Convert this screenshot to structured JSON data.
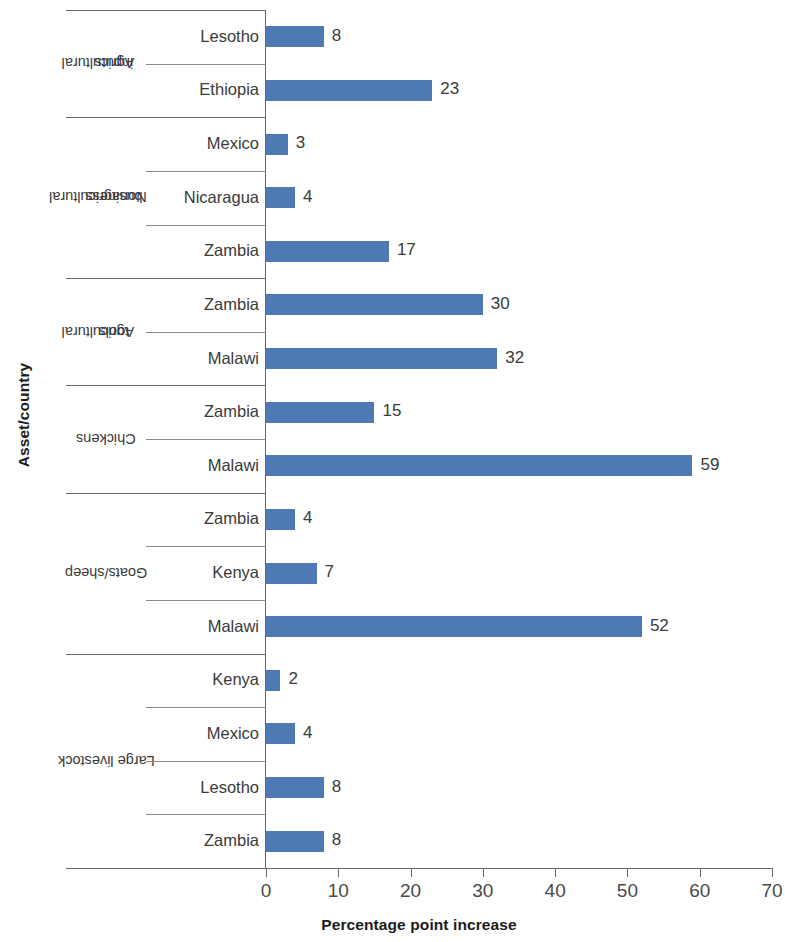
{
  "chart_data": {
    "type": "bar",
    "orientation": "horizontal",
    "title": "",
    "xlabel": "Percentage point increase",
    "ylabel": "Asset/country",
    "xlim": [
      0,
      70
    ],
    "xticks": [
      0,
      10,
      20,
      30,
      40,
      50,
      60,
      70
    ],
    "grid": false,
    "legend": null,
    "bar_color": "#4e79b2",
    "groups": [
      {
        "label": "Agricultural inputs",
        "label_lines": [
          "Agricultural",
          "inputs"
        ],
        "rows": [
          {
            "category": "Lesotho",
            "value": 8
          },
          {
            "category": "Ethiopia",
            "value": 23
          }
        ]
      },
      {
        "label": "Nonagricultural business",
        "label_lines": [
          "Nonagricultural",
          "business"
        ],
        "rows": [
          {
            "category": "Mexico",
            "value": 3
          },
          {
            "category": "Nicaragua",
            "value": 4
          },
          {
            "category": "Zambia",
            "value": 17
          }
        ]
      },
      {
        "label": "Agricultural tools",
        "label_lines": [
          "Agricultural",
          "tools"
        ],
        "rows": [
          {
            "category": "Zambia",
            "value": 30
          },
          {
            "category": "Malawi",
            "value": 32
          }
        ]
      },
      {
        "label": "Chickens",
        "label_lines": [
          "Chickens"
        ],
        "rows": [
          {
            "category": "Zambia",
            "value": 15
          },
          {
            "category": "Malawi",
            "value": 59
          }
        ]
      },
      {
        "label": "Goats/sheep",
        "label_lines": [
          "Goats/sheep"
        ],
        "rows": [
          {
            "category": "Zambia",
            "value": 4
          },
          {
            "category": "Kenya",
            "value": 7
          },
          {
            "category": "Malawi",
            "value": 52
          }
        ]
      },
      {
        "label": "Large livestock",
        "label_lines": [
          "Large livestock"
        ],
        "rows": [
          {
            "category": "Kenya",
            "value": 2
          },
          {
            "category": "Mexico",
            "value": 4
          },
          {
            "category": "Lesotho",
            "value": 8
          },
          {
            "category": "Zambia",
            "value": 8
          }
        ]
      }
    ],
    "categories": [
      "Lesotho",
      "Ethiopia",
      "Mexico",
      "Nicaragua",
      "Zambia",
      "Zambia",
      "Malawi",
      "Zambia",
      "Malawi",
      "Zambia",
      "Kenya",
      "Malawi",
      "Kenya",
      "Mexico",
      "Lesotho",
      "Zambia"
    ],
    "values": [
      8,
      23,
      3,
      4,
      17,
      30,
      32,
      15,
      59,
      4,
      7,
      52,
      2,
      4,
      8,
      8
    ]
  }
}
